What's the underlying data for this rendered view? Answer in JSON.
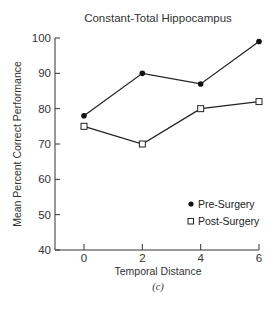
{
  "chart_data": {
    "type": "line",
    "title": "Constant-Total Hippocampus",
    "xlabel": "Temporal Distance",
    "ylabel": "Mean Percent Correct Performance",
    "caption": "(c)",
    "x": [
      0,
      2,
      4,
      6
    ],
    "x_ticks": [
      "0",
      "2",
      "4",
      "6"
    ],
    "y_ticks": [
      "40",
      "50",
      "60",
      "70",
      "80",
      "90",
      "100"
    ],
    "ylim": [
      40,
      100
    ],
    "xlim": [
      -1,
      6
    ],
    "grid": false,
    "legend_position": "lower right",
    "series": [
      {
        "name": "Pre-Surgery",
        "marker": "filled-circle",
        "color": "#111111",
        "values": [
          78,
          90,
          87,
          99
        ]
      },
      {
        "name": "Post-Surgery",
        "marker": "open-square",
        "color": "#111111",
        "values": [
          75,
          70,
          80,
          82
        ]
      }
    ]
  }
}
